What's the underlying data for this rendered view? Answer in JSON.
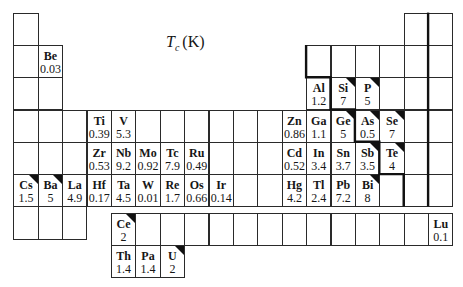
{
  "title": {
    "symbol": "T",
    "subscript": "c",
    "unit": "(K)"
  },
  "legend_marker_meaning": "corner triangle marks elements drawn with a black top-right triangle",
  "colors": {
    "line": "#2a2a2a",
    "text": "#161616",
    "background": "#ffffff"
  },
  "elements": [
    {
      "symbol": "Be",
      "tc": "0.03",
      "period": 2,
      "group": 2,
      "marker": false
    },
    {
      "symbol": "Al",
      "tc": "1.2",
      "period": 3,
      "group": 13,
      "marker": false
    },
    {
      "symbol": "Si",
      "tc": "7",
      "period": 3,
      "group": 14,
      "marker": true
    },
    {
      "symbol": "P",
      "tc": "5",
      "period": 3,
      "group": 15,
      "marker": true
    },
    {
      "symbol": "Ti",
      "tc": "0.39",
      "period": 4,
      "group": 4,
      "marker": false
    },
    {
      "symbol": "V",
      "tc": "5.3",
      "period": 4,
      "group": 5,
      "marker": false
    },
    {
      "symbol": "Zn",
      "tc": "0.86",
      "period": 4,
      "group": 12,
      "marker": false
    },
    {
      "symbol": "Ga",
      "tc": "1.1",
      "period": 4,
      "group": 13,
      "marker": false
    },
    {
      "symbol": "Ge",
      "tc": "5",
      "period": 4,
      "group": 14,
      "marker": true
    },
    {
      "symbol": "As",
      "tc": "0.5",
      "period": 4,
      "group": 15,
      "marker": true
    },
    {
      "symbol": "Se",
      "tc": "7",
      "period": 4,
      "group": 16,
      "marker": true
    },
    {
      "symbol": "Zr",
      "tc": "0.53",
      "period": 5,
      "group": 4,
      "marker": false
    },
    {
      "symbol": "Nb",
      "tc": "9.2",
      "period": 5,
      "group": 5,
      "marker": false
    },
    {
      "symbol": "Mo",
      "tc": "0.92",
      "period": 5,
      "group": 6,
      "marker": false
    },
    {
      "symbol": "Tc",
      "tc": "7.9",
      "period": 5,
      "group": 7,
      "marker": false
    },
    {
      "symbol": "Ru",
      "tc": "0.49",
      "period": 5,
      "group": 8,
      "marker": false
    },
    {
      "symbol": "Cd",
      "tc": "0.52",
      "period": 5,
      "group": 12,
      "marker": false
    },
    {
      "symbol": "In",
      "tc": "3.4",
      "period": 5,
      "group": 13,
      "marker": false
    },
    {
      "symbol": "Sn",
      "tc": "3.7",
      "period": 5,
      "group": 14,
      "marker": false
    },
    {
      "symbol": "Sb",
      "tc": "3.5",
      "period": 5,
      "group": 15,
      "marker": true
    },
    {
      "symbol": "Te",
      "tc": "4",
      "period": 5,
      "group": 16,
      "marker": true
    },
    {
      "symbol": "Cs",
      "tc": "1.5",
      "period": 6,
      "group": 1,
      "marker": true
    },
    {
      "symbol": "Ba",
      "tc": "5",
      "period": 6,
      "group": 2,
      "marker": true
    },
    {
      "symbol": "La",
      "tc": "4.9",
      "period": 6,
      "group": 3,
      "marker": false
    },
    {
      "symbol": "Hf",
      "tc": "0.17",
      "period": 6,
      "group": 4,
      "marker": false
    },
    {
      "symbol": "Ta",
      "tc": "4.5",
      "period": 6,
      "group": 5,
      "marker": false
    },
    {
      "symbol": "W",
      "tc": "0.01",
      "period": 6,
      "group": 6,
      "marker": false
    },
    {
      "symbol": "Re",
      "tc": "1.7",
      "period": 6,
      "group": 7,
      "marker": false
    },
    {
      "symbol": "Os",
      "tc": "0.66",
      "period": 6,
      "group": 8,
      "marker": false
    },
    {
      "symbol": "Ir",
      "tc": "0.14",
      "period": 6,
      "group": 9,
      "marker": false
    },
    {
      "symbol": "Hg",
      "tc": "4.2",
      "period": 6,
      "group": 12,
      "marker": false
    },
    {
      "symbol": "Tl",
      "tc": "2.4",
      "period": 6,
      "group": 13,
      "marker": false
    },
    {
      "symbol": "Pb",
      "tc": "7.2",
      "period": 6,
      "group": 14,
      "marker": false
    },
    {
      "symbol": "Bi",
      "tc": "8",
      "period": 6,
      "group": 15,
      "marker": true
    }
  ],
  "f_block": [
    {
      "symbol": "Ce",
      "tc": "2",
      "series": "lanthanides",
      "position": 1,
      "marker": true
    },
    {
      "symbol": "Lu",
      "tc": "0.1",
      "series": "lanthanides",
      "position": 14,
      "marker": false
    },
    {
      "symbol": "Th",
      "tc": "1.4",
      "series": "actinides",
      "position": 1,
      "marker": false
    },
    {
      "symbol": "Pa",
      "tc": "1.4",
      "series": "actinides",
      "position": 2,
      "marker": false
    },
    {
      "symbol": "U",
      "tc": "2",
      "series": "actinides",
      "position": 3,
      "marker": true
    }
  ]
}
